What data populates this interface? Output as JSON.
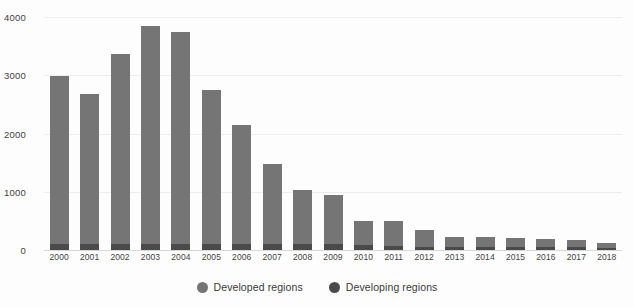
{
  "chart_data": {
    "type": "bar",
    "subtype": "stacked-bar",
    "title": "",
    "subtitle": "",
    "xlabel": "",
    "ylabel": "",
    "ylim": [
      0,
      4000
    ],
    "yticks": [
      0,
      1000,
      2000,
      3000,
      4000
    ],
    "ytick_labels": [
      "0",
      "1000",
      "2000",
      "3000",
      "4000"
    ],
    "grid": true,
    "legend_position": "bottom-center",
    "categories": [
      "2000",
      "2001",
      "2002",
      "2003",
      "2004",
      "2005",
      "2006",
      "2007",
      "2008",
      "2009",
      "2010",
      "2011",
      "2012",
      "2013",
      "2014",
      "2015",
      "2016",
      "2017",
      "2018"
    ],
    "series": [
      {
        "name": "Developed regions",
        "color": "#4a4a4a",
        "values": [
          100,
          100,
          100,
          100,
          100,
          110,
          110,
          110,
          110,
          105,
          80,
          70,
          60,
          55,
          50,
          50,
          50,
          45,
          40
        ]
      },
      {
        "name": "Developing regions",
        "color": "#757575",
        "values": [
          2880,
          2580,
          3270,
          3745,
          3645,
          2635,
          2035,
          1370,
          920,
          845,
          420,
          420,
          290,
          175,
          165,
          150,
          145,
          125,
          80
        ]
      }
    ],
    "totals": [
      2980,
      2680,
      3370,
      3845,
      3745,
      2745,
      2145,
      1480,
      1030,
      950,
      500,
      490,
      350,
      230,
      215,
      200,
      195,
      170,
      120
    ]
  },
  "legend": {
    "items": [
      {
        "label": "Developed regions",
        "marker": "circle-marker",
        "color": "#757575"
      },
      {
        "label": "Developing regions",
        "marker": "circle-marker",
        "color": "#4a4a4a"
      }
    ]
  }
}
